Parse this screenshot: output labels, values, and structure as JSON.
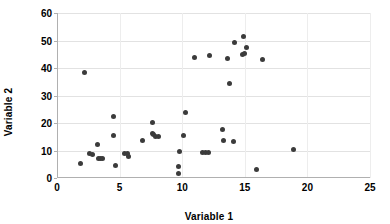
{
  "chart_data": {
    "type": "scatter",
    "title": "",
    "xlabel": "Variable 1",
    "ylabel": "Variable 2",
    "xlim": [
      0,
      25
    ],
    "ylim": [
      0,
      60
    ],
    "xticks": [
      0,
      5,
      10,
      15,
      20,
      25
    ],
    "yticks": [
      0,
      10,
      20,
      30,
      40,
      50,
      60
    ],
    "grid": true,
    "legend": "none",
    "marker_color": "#3b3b3b",
    "grid_color": "#e2e2e2",
    "axis_color": "#b0b0b0",
    "series": [
      {
        "name": "observations",
        "points": [
          [
            1.9,
            5.2
          ],
          [
            2.2,
            38.2
          ],
          [
            2.6,
            8.8
          ],
          [
            2.8,
            8.7
          ],
          [
            3.2,
            12.3
          ],
          [
            3.3,
            7.2
          ],
          [
            3.5,
            7.0
          ],
          [
            3.6,
            7.2
          ],
          [
            4.5,
            22.4
          ],
          [
            4.5,
            15.4
          ],
          [
            4.7,
            4.6
          ],
          [
            5.4,
            9.0
          ],
          [
            5.6,
            8.9
          ],
          [
            5.7,
            8.0
          ],
          [
            6.8,
            13.6
          ],
          [
            7.6,
            20.3
          ],
          [
            7.6,
            16.3
          ],
          [
            7.7,
            15.9
          ],
          [
            7.9,
            15.0
          ],
          [
            8.1,
            15.0
          ],
          [
            9.7,
            4.3
          ],
          [
            9.7,
            1.5
          ],
          [
            9.8,
            9.5
          ],
          [
            10.1,
            15.4
          ],
          [
            10.3,
            23.7
          ],
          [
            11.0,
            43.9
          ],
          [
            11.6,
            9.1
          ],
          [
            11.9,
            9.2
          ],
          [
            12.1,
            9.3
          ],
          [
            12.2,
            44.5
          ],
          [
            13.2,
            17.6
          ],
          [
            13.3,
            13.6
          ],
          [
            13.6,
            43.3
          ],
          [
            13.8,
            34.2
          ],
          [
            14.1,
            13.2
          ],
          [
            14.2,
            49.2
          ],
          [
            14.8,
            45.0
          ],
          [
            14.9,
            51.6
          ],
          [
            15.0,
            45.3
          ],
          [
            15.1,
            47.3
          ],
          [
            15.9,
            3.2
          ],
          [
            16.4,
            43.0
          ],
          [
            18.9,
            10.2
          ]
        ]
      }
    ]
  }
}
